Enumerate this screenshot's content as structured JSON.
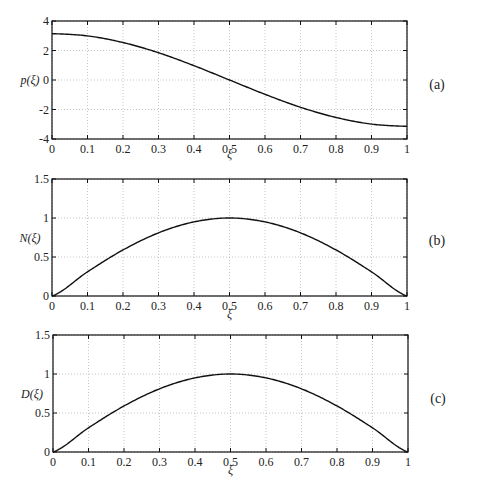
{
  "chart_data": [
    {
      "type": "line",
      "panel_label": "(a)",
      "title": "",
      "xlabel": "ξ",
      "ylabel": "p(ξ)",
      "xlim": [
        0,
        1
      ],
      "ylim": [
        -4,
        4
      ],
      "x_ticks": [
        "0",
        "0.1",
        "0.2",
        "0.3",
        "0.4",
        "0.5",
        "0.6",
        "0.7",
        "0.8",
        "0.9",
        "1"
      ],
      "y_ticks": [
        "-4",
        "-2",
        "0",
        "2",
        "4"
      ],
      "grid": true,
      "x": [
        0,
        0.1,
        0.2,
        0.3,
        0.4,
        0.5,
        0.6,
        0.7,
        0.8,
        0.9,
        1.0
      ],
      "series": [
        {
          "name": "p(ξ)",
          "values": [
            3.14,
            2.99,
            2.54,
            1.85,
            0.97,
            0.0,
            -0.97,
            -1.85,
            -2.54,
            -2.99,
            -3.14
          ]
        }
      ]
    },
    {
      "type": "line",
      "panel_label": "(b)",
      "title": "",
      "xlabel": "ξ",
      "ylabel": "N(ξ)",
      "xlim": [
        0,
        1
      ],
      "ylim": [
        0,
        1.5
      ],
      "x_ticks": [
        "0",
        "0.1",
        "0.2",
        "0.3",
        "0.4",
        "0.5",
        "0.6",
        "0.7",
        "0.8",
        "0.9",
        "1"
      ],
      "y_ticks": [
        "0",
        "0.5",
        "1",
        "1.5"
      ],
      "grid": true,
      "x": [
        0,
        0.1,
        0.2,
        0.3,
        0.4,
        0.5,
        0.6,
        0.7,
        0.8,
        0.9,
        1.0
      ],
      "series": [
        {
          "name": "N(ξ)",
          "values": [
            0.0,
            0.31,
            0.59,
            0.81,
            0.95,
            1.0,
            0.95,
            0.81,
            0.59,
            0.31,
            0.0
          ]
        }
      ]
    },
    {
      "type": "line",
      "panel_label": "(c)",
      "title": "",
      "xlabel": "ξ",
      "ylabel": "D(ξ)",
      "xlim": [
        0,
        1
      ],
      "ylim": [
        0,
        1.5
      ],
      "x_ticks": [
        "0",
        "0.1",
        "0.2",
        "0.3",
        "0.4",
        "0.5",
        "0.6",
        "0.7",
        "0.8",
        "0.9",
        "1"
      ],
      "y_ticks": [
        "0",
        "0.5",
        "1",
        "1.5"
      ],
      "grid": true,
      "x": [
        0,
        0.1,
        0.2,
        0.3,
        0.4,
        0.5,
        0.6,
        0.7,
        0.8,
        0.9,
        1.0
      ],
      "series": [
        {
          "name": "D(ξ)",
          "values": [
            0.0,
            0.31,
            0.59,
            0.81,
            0.95,
            1.0,
            0.95,
            0.81,
            0.59,
            0.31,
            0.0
          ]
        }
      ]
    }
  ]
}
